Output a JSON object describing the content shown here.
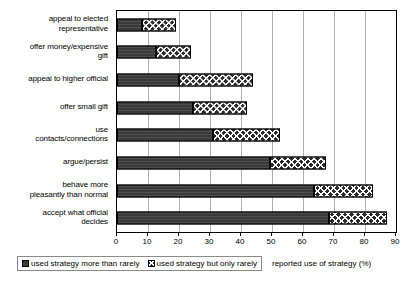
{
  "chart_data": {
    "type": "bar",
    "orientation": "horizontal",
    "stacked": true,
    "title": "",
    "subtitle": "",
    "xlabel": "reported use of strategy (%)",
    "ylabel": "",
    "xlim": [
      0,
      90
    ],
    "xticks": [
      0,
      10,
      20,
      30,
      40,
      50,
      60,
      70,
      80,
      90
    ],
    "xtick_labels": [
      "0",
      "10",
      "20",
      "30",
      "40",
      "50",
      "60",
      "70",
      "80",
      "90"
    ],
    "grid": "vertical",
    "legend_position": "bottom-left",
    "categories": [
      "appeal to elected representative",
      "offer money/expensive gift",
      "appeal to higher official",
      "offer small gift",
      "use contacts/connections",
      "argue/persist",
      "behave more pleasantly than normal",
      "accept what official decides"
    ],
    "category_label_lines": [
      [
        "appeal to elected",
        "representative"
      ],
      [
        "offer money/expensive",
        "gift"
      ],
      [
        "appeal to higher official"
      ],
      [
        "offer small gift"
      ],
      [
        "use",
        "contacts/connections"
      ],
      [
        "argue/persist"
      ],
      [
        "behave more",
        "pleasantly than normal"
      ],
      [
        "accept what official",
        "decides"
      ]
    ],
    "series": [
      {
        "name": "used strategy more than rarely",
        "color": "#3a3a3a",
        "pattern": "solid-dark",
        "values": [
          8,
          12.5,
          20,
          24.5,
          31,
          49.5,
          63.5,
          68.5
        ]
      },
      {
        "name": "used strategy but only rarely",
        "color": "#2b2b2b",
        "pattern": "checkerboard",
        "values": [
          11,
          11.5,
          24,
          17.5,
          21.5,
          18,
          19,
          18.5
        ]
      }
    ],
    "totals": [
      19,
      24,
      44,
      42,
      52.5,
      67.5,
      82.5,
      87
    ]
  },
  "legend": {
    "entries": [
      {
        "label": "used strategy more than rarely",
        "swatch": "solid-dark-swatch"
      },
      {
        "label": "used strategy but only rarely",
        "swatch": "checkerboard-swatch"
      }
    ]
  },
  "axis": {
    "x_title": "reported use of strategy (%)"
  }
}
